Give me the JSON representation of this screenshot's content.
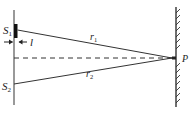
{
  "diagram": {
    "labels": {
      "s1": "S",
      "s1_sub": "1",
      "s2": "S",
      "s2_sub": "2",
      "slit_width": "l",
      "r1": "r",
      "r1_sub": "1",
      "r2": "r",
      "r2_sub": "2",
      "point": "P"
    },
    "colors": {
      "line": "#333333",
      "slit": "#111111",
      "background": "#ffffff"
    }
  }
}
